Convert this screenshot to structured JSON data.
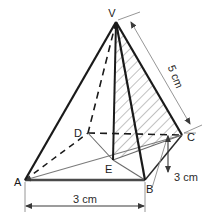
{
  "figure": {
    "background_color": "#ffffff",
    "edge_color": "#1a1a1a",
    "dimension_color": "#6e6e6e",
    "hatch_color": "#8d8d8d",
    "vertices": [
      {
        "name": "V",
        "label": "V",
        "x": 116,
        "y": 22,
        "label_x": 113,
        "label_y": 14,
        "hidden": false
      },
      {
        "name": "A",
        "label": "A",
        "x": 25,
        "y": 180,
        "label_x": 13,
        "label_y": 184,
        "hidden": false
      },
      {
        "name": "B",
        "label": "B",
        "x": 145,
        "y": 180,
        "label_x": 147,
        "label_y": 192,
        "hidden": false
      },
      {
        "name": "C",
        "label": "C",
        "x": 182,
        "y": 135,
        "label_x": 188,
        "label_y": 140,
        "hidden": false
      },
      {
        "name": "D",
        "label": "D",
        "x": 88,
        "y": 133,
        "label_x": 77,
        "label_y": 137,
        "hidden": true
      },
      {
        "name": "E",
        "label": "E",
        "x": 113,
        "y": 160,
        "label_x": 108,
        "label_y": 172,
        "hidden": false
      }
    ],
    "dimensions": [
      {
        "name": "base-width",
        "label": "3 cm",
        "from": "A",
        "to": "B",
        "label_x": 85,
        "label_y": 203,
        "rotation": 0
      },
      {
        "name": "base-depth",
        "label": "3 cm",
        "from": "B",
        "to": "C",
        "label_x": 192,
        "label_y": 180,
        "rotation": 0
      },
      {
        "name": "slant-edge",
        "label": "5 cm",
        "from": "V",
        "to": "C",
        "label_x": 172,
        "label_y": 78,
        "rotation": 68
      }
    ],
    "hatched_region": {
      "name": "cross-section-VEC",
      "points": "116,22 113,160 182,135",
      "hatch_angle_deg": 45
    }
  }
}
